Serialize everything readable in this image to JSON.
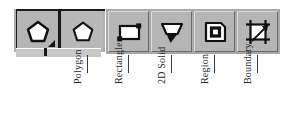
{
  "toolbar": {
    "name": "Draw toolbar",
    "flyout_group": {
      "open": true,
      "buttons": [
        {
          "id": "polygon-active",
          "label": "Polygon",
          "icon": "pentagon-polygon-icon",
          "state": "pressed",
          "has_flyout_arrow": true
        },
        {
          "id": "polygon-alt",
          "label": "Polygon",
          "icon": "pentagon-polygon-icon",
          "state": "normal",
          "has_flyout_arrow": false
        }
      ]
    },
    "buttons": [
      {
        "id": "rectangle",
        "label": "Rectangle",
        "icon": "rectangle-icon"
      },
      {
        "id": "2dsolid",
        "label": "2D Solid",
        "icon": "2d-solid-icon"
      },
      {
        "id": "region",
        "label": "Region",
        "icon": "region-icon"
      },
      {
        "id": "boundary",
        "label": "Boundary",
        "icon": "boundary-hatch-icon"
      }
    ]
  },
  "callouts": [
    {
      "id": "polygon",
      "label": "Polygon"
    },
    {
      "id": "rectangle",
      "label": "Rectangle"
    },
    {
      "id": "2dsolid",
      "label": "2D Solid"
    },
    {
      "id": "region",
      "label": "Region"
    },
    {
      "id": "boundary",
      "label": "Boundary"
    }
  ],
  "colors": {
    "button_face": "#b5b5b5",
    "toolbar_face": "#a9a9a9",
    "border_dark": "#1a1a1a",
    "highlight": "#dcdcdc",
    "shadow": "#6a6a6a",
    "icon_line": "#111111",
    "label_text": "#2a2a2a",
    "leader_line": "#3a3a3a",
    "page_background": "#ffffff"
  }
}
